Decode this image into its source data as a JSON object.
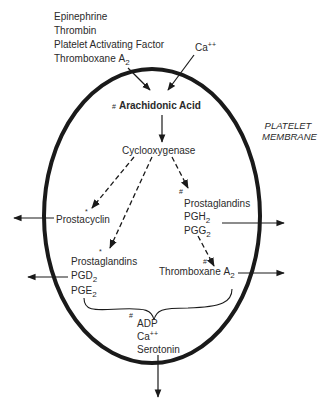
{
  "stimuli": {
    "items": [
      "Epinephrine",
      "Thrombin",
      "Platelet Activating Factor",
      "Thromboxane"
    ],
    "thromboxane_sub": "2",
    "thromboxane_letter": "A"
  },
  "calcium_in": {
    "label": "Ca",
    "sup": "++"
  },
  "membrane_label": {
    "line1": "PLATELET",
    "line2": "MEMBRANE"
  },
  "arachidonic": {
    "mark": "#",
    "label": "Arachidonic Acid"
  },
  "enzyme": {
    "label": "Cyclooxygenase"
  },
  "prostacyclin": {
    "mark": "*",
    "label": "Prostacyclin"
  },
  "prostaglandins_left": {
    "mark": "*",
    "label": "Prostaglandins",
    "items": [
      {
        "base": "PGD",
        "sub": "2"
      },
      {
        "base": "PGE",
        "sub": "2"
      }
    ]
  },
  "prostaglandins_right": {
    "mark": "#",
    "label": "Prostaglandins",
    "items": [
      {
        "base": "PGH",
        "sub": "2"
      },
      {
        "base": "PGG",
        "sub": "2"
      }
    ]
  },
  "thromboxane": {
    "mark": "#",
    "label": "Thromboxane",
    "letter": "A",
    "sub": "2"
  },
  "released": {
    "mark": "#",
    "items": [
      "ADP",
      "Ca",
      "Serotonin"
    ],
    "ca_sup": "++"
  },
  "colors": {
    "stroke": "#1a1a1a",
    "text": "#2a2a2a",
    "background": "#ffffff"
  }
}
